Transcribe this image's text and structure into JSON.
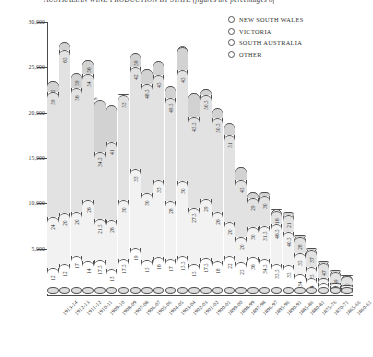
{
  "chart_data": {
    "type": "bar",
    "title": "AUSTRALIAN WINE PRODUCTION BY STATE (figures are percentages of the annual total)",
    "ylabel": "AUSTRALIAN WINE PRODUCTION IN '000 LITRES",
    "xlabel": "",
    "ylim": [
      0,
      30000
    ],
    "yticks": [
      "5,000",
      "10,000",
      "15,000",
      "20,000",
      "25,000",
      "30,000"
    ],
    "ytick_values": [
      5000,
      10000,
      15000,
      20000,
      25000,
      30000
    ],
    "grid": false,
    "legend_position": "top-right",
    "stacked": true,
    "series_names": [
      "NEW SOUTH WALES",
      "VICTORIA",
      "SOUTH AUSTRALIA",
      "OTHER"
    ],
    "categories": [
      "1913-14",
      "1912-13",
      "1911-12",
      "1910-11",
      "1909-10",
      "1908-09",
      "1907-08",
      "1906-07",
      "1905-06",
      "1904-05",
      "1903-04",
      "1902-03",
      "1901-02",
      "1900-01",
      "1899-00",
      "1898-99",
      "1897-98",
      "1896-97",
      "1895-96",
      "1890-91",
      "1885-86",
      "1880-81",
      "1875-76",
      "1870-71",
      "1865-66",
      "1860-61"
    ],
    "totals": [
      23500,
      27800,
      24400,
      25800,
      21300,
      20900,
      21800,
      26600,
      24800,
      25700,
      22900,
      27300,
      22200,
      22600,
      20500,
      18900,
      14000,
      11200,
      11300,
      9400,
      9000,
      6500,
      5100,
      3600,
      2600,
      2100
    ],
    "series": [
      {
        "name": "NEW SOUTH WALES",
        "values": [
          12,
          12,
          17,
          14,
          17.5,
          13,
          17.5,
          19,
          15,
          16,
          17,
          15.5,
          15,
          17.5,
          18,
          22,
          25,
          36,
          34.5,
          35.5,
          35,
          34,
          34,
          34,
          34,
          34
        ]
      },
      {
        "name": "VICTORIA",
        "values": [
          24,
          20,
          20,
          26,
          21.5,
          26,
          30,
          33,
          30,
          33,
          28,
          30,
          27.5,
          29,
          26,
          20,
          20,
          30,
          31.5,
          46.5,
          40.5,
          35,
          25,
          15,
          12,
          12
        ]
      },
      {
        "name": "SOUTH AUSTRALIA",
        "values": [
          59,
          65,
          56,
          54,
          34.5,
          41,
          53,
          42,
          48.5,
          45,
          49.5,
          45,
          45.5,
          50.5,
          50.5,
          51,
          45,
          29,
          30,
          16,
          21,
          28,
          37,
          47,
          49,
          50
        ]
      },
      {
        "name": "OTHER",
        "values": [
          5,
          3,
          7,
          6,
          27,
          20,
          -0.5,
          6,
          6.5,
          6,
          5.5,
          9.5,
          12,
          3,
          5.5,
          7,
          10,
          5,
          4,
          2,
          3.5,
          3,
          4,
          4,
          5,
          4
        ]
      }
    ],
    "bar_labels": {
      "nsw": [
        "12",
        "12",
        "17",
        "14",
        "17.5",
        "13",
        "17.5",
        "19",
        "15",
        "16",
        "17",
        "15.5",
        "15",
        "17.5",
        "18",
        "22",
        "25",
        "36",
        "34.5",
        "35.5",
        "35",
        "34",
        "34",
        "34",
        "34",
        "34"
      ],
      "vic": [
        "24",
        "20",
        "20",
        "26",
        "21.5",
        "26",
        "30",
        "33",
        "30",
        "33",
        "28",
        "30",
        "27.5",
        "29",
        "26",
        "20",
        "20",
        "30",
        "31.5",
        "46.5",
        "40.5",
        "35",
        "25",
        "15",
        "12",
        "12"
      ],
      "sa": [
        "59",
        "65",
        "56",
        "54",
        "34.5",
        "41",
        "53",
        "42",
        "48.5",
        "45",
        "49.5",
        "45",
        "45.5",
        "50.5",
        "50.5",
        "51",
        "45",
        "29",
        "30",
        "16",
        "21",
        "28",
        "37",
        "47",
        "49",
        "50"
      ],
      "top": [
        "5",
        "73",
        "59",
        "56",
        "",
        "",
        "",
        "59",
        "",
        "",
        "",
        "",
        "",
        "",
        "",
        "",
        "",
        "",
        "",
        "",
        "",
        "",
        "",
        "7",
        "5",
        "62"
      ]
    }
  },
  "legend": {
    "items": [
      {
        "label": "NEW SOUTH WALES",
        "marker": "circle-outline"
      },
      {
        "label": "VICTORIA",
        "marker": "circle-outline"
      },
      {
        "label": "SOUTH AUSTRALIA",
        "marker": "circle-outline"
      },
      {
        "label": "OTHER",
        "marker": "circle-outline"
      }
    ]
  }
}
